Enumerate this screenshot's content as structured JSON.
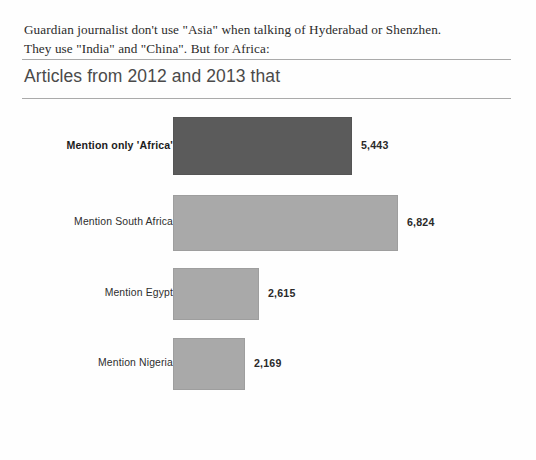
{
  "intro": {
    "line1": "Guardian journalist don't use \"Asia\" when talking of Hyderabad or Shenzhen.",
    "line2": "They use \"India\" and \"China\". But for Africa:"
  },
  "chart": {
    "title": "Articles from 2012 and 2013 that"
  },
  "caption": {
    "marker_icon": "triangle-up-icon",
    "marker_glyph": "▲",
    "text": "Articles that mention only Africa Photograph: NKD"
  },
  "colors": {
    "bar_dark": "#5b5b5b",
    "bar_light": "#a9a9a9",
    "rule": "#9b9b9b",
    "title_text": "#4a4a4a",
    "body_text": "#2b2b2b",
    "caption_text": "#6f6f6f",
    "background": "#fefefe"
  },
  "chart_data": {
    "type": "bar",
    "orientation": "horizontal",
    "title": "Articles from 2012 and 2013 that",
    "subtitle": "",
    "xlabel": "",
    "ylabel": "",
    "grid": false,
    "legend": "none",
    "axis_visible": false,
    "xlim": [
      0,
      6824
    ],
    "categories": [
      "Mention only 'Africa'",
      "Mention South Africa",
      "Mention Egypt",
      "Mention Nigeria"
    ],
    "values": [
      5443,
      6824,
      2615,
      2169
    ],
    "value_labels": [
      "5,443",
      "6,824",
      "2,615",
      "2,169"
    ],
    "bars": [
      {
        "label": "Mention only 'Africa'",
        "value": 5443,
        "value_label": "5,443",
        "emphasis": true,
        "tone": "dark",
        "color": "#5b5b5b"
      },
      {
        "label": "Mention South Africa",
        "value": 6824,
        "value_label": "6,824",
        "emphasis": false,
        "tone": "light",
        "color": "#a9a9a9"
      },
      {
        "label": "Mention Egypt",
        "value": 2615,
        "value_label": "2,615",
        "emphasis": false,
        "tone": "light",
        "color": "#a9a9a9"
      },
      {
        "label": "Mention Nigeria",
        "value": 2169,
        "value_label": "2,169",
        "emphasis": false,
        "tone": "light",
        "color": "#a9a9a9"
      }
    ]
  }
}
